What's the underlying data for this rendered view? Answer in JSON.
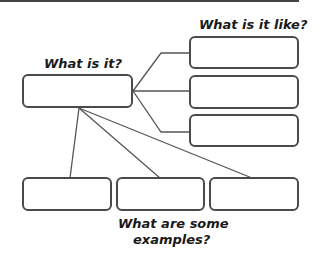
{
  "diagram": {
    "type": "concept-map",
    "labels": {
      "definition": "What is it?",
      "characteristics": "What is it like?",
      "examples_line1": "What are some",
      "examples_line2": "examples?"
    },
    "nodes": {
      "definition": {
        "text": ""
      },
      "characteristics": [
        {
          "text": ""
        },
        {
          "text": ""
        },
        {
          "text": ""
        }
      ],
      "examples": [
        {
          "text": ""
        },
        {
          "text": ""
        },
        {
          "text": ""
        }
      ]
    },
    "colors": {
      "stroke": "#4a4a4a",
      "text": "#1a1a1a",
      "background": "#ffffff"
    }
  }
}
